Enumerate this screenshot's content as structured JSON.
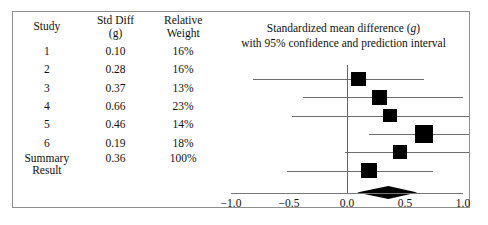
{
  "figure": {
    "frame_color": "#8e8e8e",
    "marker_color": "#000000",
    "line_color": "#6d6d6d"
  },
  "table": {
    "headers": {
      "study": {
        "line1": "Study",
        "line2": ""
      },
      "effect": {
        "line1": "Std Diff",
        "line2": "(g)"
      },
      "weight": {
        "line1": "Relative",
        "line2": "Weight"
      }
    },
    "rows": [
      {
        "study": "1",
        "effect": "0.10",
        "weight": "16%"
      },
      {
        "study": "2",
        "effect": "0.28",
        "weight": "16%"
      },
      {
        "study": "3",
        "effect": "0.37",
        "weight": "13%"
      },
      {
        "study": "4",
        "effect": "0.66",
        "weight": "23%"
      },
      {
        "study": "5",
        "effect": "0.46",
        "weight": "14%"
      },
      {
        "study": "6",
        "effect": "0.19",
        "weight": "18%"
      }
    ],
    "summary": {
      "label_line1": "Summary",
      "label_line2": "Result",
      "effect": "0.36",
      "weight": "100%"
    }
  },
  "plot": {
    "title_line1": "Standardized mean difference (g)",
    "title_line2": "with 95% confidence and prediction interval",
    "tick_labels": [
      "−1.0",
      "−0.5",
      "0.0",
      "0.5",
      "1.0"
    ],
    "tick_values": [
      -1.0,
      -0.5,
      0.0,
      0.5,
      1.0
    ]
  },
  "chart_data": {
    "type": "forest",
    "title": "Standardized mean difference (g) with 95% confidence and prediction interval",
    "xlabel": "Standardized mean difference (g)",
    "ylabel": "",
    "xlim": [
      -1.0,
      1.0
    ],
    "xticks": [
      -1.0,
      -0.5,
      0.0,
      0.5,
      1.0
    ],
    "xticklabels": [
      "−1.0",
      "−0.5",
      "0.0",
      "0.5",
      "1.0"
    ],
    "grid": false,
    "null_line": 0.0,
    "effect_measure": "Std Diff (g)",
    "studies": [
      {
        "label": "1",
        "effect": 0.1,
        "ci_low": -0.81,
        "ci_high": 0.66,
        "weight_pct": 16
      },
      {
        "label": "2",
        "effect": 0.28,
        "ci_low": -0.38,
        "ci_high": 1.0,
        "weight_pct": 16
      },
      {
        "label": "3",
        "effect": 0.37,
        "ci_low": -0.47,
        "ci_high": 1.16,
        "weight_pct": 13
      },
      {
        "label": "4",
        "effect": 0.66,
        "ci_low": 0.19,
        "ci_high": 1.12,
        "weight_pct": 23
      },
      {
        "label": "5",
        "effect": 0.46,
        "ci_low": -0.02,
        "ci_high": 1.07,
        "weight_pct": 14
      },
      {
        "label": "6",
        "effect": 0.19,
        "ci_low": -0.52,
        "ci_high": 0.74,
        "weight_pct": 18
      }
    ],
    "summary": {
      "label": "Summary Result",
      "effect": 0.36,
      "ci_low": 0.09,
      "ci_high": 0.61,
      "weight_pct": 100,
      "shape": "diamond"
    }
  }
}
